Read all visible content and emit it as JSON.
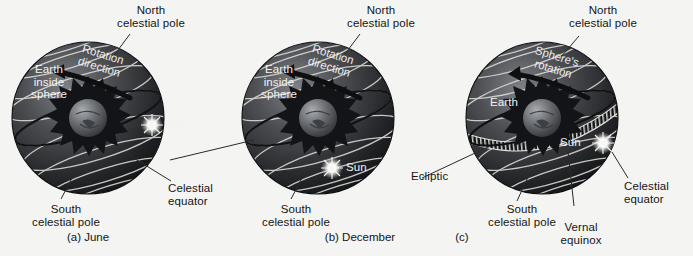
{
  "figure": {
    "background_color": "#f4f4f2",
    "sphere_color_dark": "#17181a",
    "sphere_color_mid": "#4a4c50",
    "sphere_color_light": "#8d9095",
    "grid_line_color": "#d8d8d4",
    "label_color": "#141414",
    "label_color_on_sphere": "#f2f2f2",
    "sun_color": "#f2f2f2",
    "earth_color": "#6d7074"
  },
  "panels": [
    {
      "id": "a",
      "caption": "(a) June",
      "labels": {
        "north_pole": "North\ncelestial pole",
        "south_pole": "South\ncelestial pole",
        "earth_inside": "Earth\ninside\nsphere",
        "rotation": "Rotation\ndirection",
        "sun": "Sun",
        "celestial_equator": "Celestial\nequator"
      },
      "icons": {
        "sun": "sun-icon",
        "earth": "earth-icon",
        "rotation_arrow": "rotation-arrow-icon"
      },
      "sun_position": "north of celestial equator"
    },
    {
      "id": "b",
      "caption": "(b) December",
      "labels": {
        "north_pole": "North\ncelestial pole",
        "south_pole": "South\ncelestial pole",
        "earth_inside": "Earth\ninside\nsphere",
        "rotation": "Rotation\ndirection",
        "sun": "Sun"
      },
      "icons": {
        "sun": "sun-icon",
        "earth": "earth-icon",
        "rotation_arrow": "rotation-arrow-icon"
      },
      "sun_position": "south of celestial equator"
    },
    {
      "id": "c",
      "caption": "(c)",
      "labels": {
        "north_pole": "North\ncelestial pole",
        "south_pole": "South\ncelestial pole",
        "earth": "Earth",
        "rotation": "Sphere's\nrotation",
        "sun": "Sun",
        "ecliptic": "Ecliptic",
        "vernal_equinox": "Vernal\nequinox",
        "celestial_equator": "Celestial\nequator"
      },
      "icons": {
        "sun": "sun-icon",
        "earth": "earth-icon",
        "rotation_arrow": "rotation-arrow-icon",
        "ecliptic_band": "ecliptic-band-icon"
      },
      "sun_position": "on celestial equator at vernal equinox"
    }
  ]
}
